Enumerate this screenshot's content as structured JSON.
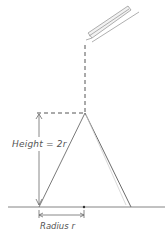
{
  "diagram": {
    "title": "",
    "labels": {
      "height": "Height = 2r",
      "radius": "Radius r"
    },
    "colors": {
      "line": "#6b6b6b",
      "dashed": "#555555",
      "pencil": "#9a9a9a",
      "background": "#ffffff"
    },
    "elements": {
      "shape": "triangle (cone cross-section)",
      "top_object": "pencil / pouring spout",
      "base_line": "ground line",
      "center_point": "center dot"
    }
  }
}
